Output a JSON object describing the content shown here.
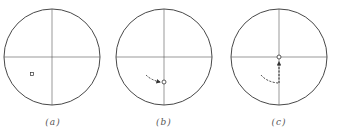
{
  "figure": {
    "panels": [
      {
        "id": "a",
        "label": "(a)",
        "center": [
          52,
          57
        ],
        "radius": 48,
        "marker": [
          32,
          74
        ],
        "path": []
      },
      {
        "id": "b",
        "label": "(b)",
        "center": [
          164,
          57
        ],
        "radius": 48,
        "marker": [
          163,
          82
        ],
        "path": "curved dashed trail from lower-left ending at marker with arrow"
      },
      {
        "id": "c",
        "label": "(c)",
        "center": [
          279,
          57
        ],
        "radius": 48,
        "marker": [
          279,
          57
        ],
        "path": "curved dashed trail then vertical dashed line up to center"
      }
    ],
    "colors": {
      "line": "#333333",
      "background": "#ffffff"
    }
  }
}
